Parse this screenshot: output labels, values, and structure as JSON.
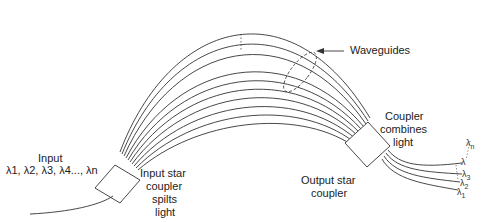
{
  "diagram": {
    "type": "arrayed-waveguide-grating",
    "labels": {
      "input_title": "Input",
      "input_wavelengths": "λ1, λ2, λ3, λ4..., λn",
      "input_coupler_line1": "Input star",
      "input_coupler_line2": "coupler",
      "input_coupler_line3": "spilts",
      "input_coupler_line4": "light",
      "waveguides": "Waveguides",
      "output_coupler_line1": "Output star",
      "output_coupler_line2": "coupler",
      "combines_line1": "Coupler",
      "combines_line2": "combines",
      "combines_line3": "light"
    },
    "output_wavelengths": [
      {
        "sym": "λ",
        "sub": "n"
      },
      {
        "sym": "λ",
        "sub": ""
      },
      {
        "sym": "λ",
        "sub": "3"
      },
      {
        "sym": "λ",
        "sub": "2"
      },
      {
        "sym": "λ",
        "sub": "1"
      }
    ],
    "stroke_color": "#333333",
    "background": "#ffffff"
  }
}
